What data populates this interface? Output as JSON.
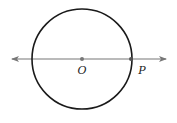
{
  "diagram": {
    "type": "geometry",
    "circle": {
      "cx": 82,
      "cy": 59,
      "r": 50,
      "stroke": "#1a1a1a"
    },
    "line": {
      "x1": 12,
      "y1": 59,
      "x2": 166,
      "y2": 59,
      "stroke": "#777777",
      "arrows": "both"
    },
    "points": [
      {
        "id": "O",
        "label": "O",
        "x": 82,
        "y": 59,
        "label_x": 82,
        "label_y": 74
      },
      {
        "id": "P",
        "label": "P",
        "x": 131,
        "y": 59,
        "label_x": 142,
        "label_y": 74
      }
    ]
  }
}
